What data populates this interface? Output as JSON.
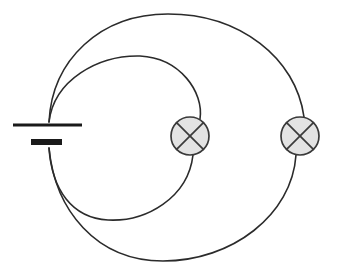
{
  "diagram": {
    "background_color": "#ffffff",
    "wire_color": "#2b2b2b",
    "lamp_fill_color": "#e3e3e3",
    "lamp_stroke_color": "#3a3a3a",
    "battery_color": "#1a1a1a",
    "width": 346,
    "height": 272
  },
  "components": {
    "battery": {
      "name": "battery",
      "icon": "battery-cell-icon",
      "positive_plate": {
        "label": "long-plate",
        "x1": 13,
        "y1": 125,
        "x2": 82,
        "y2": 125
      },
      "negative_plate": {
        "label": "short-plate",
        "x1": 31,
        "y1": 142,
        "x2": 62,
        "y2": 142
      }
    },
    "lamps": [
      {
        "name": "lamp-inner-loop",
        "icon": "lamp-cross-circle-icon",
        "cx": 190,
        "cy": 136,
        "r": 19
      },
      {
        "name": "lamp-outer-loop",
        "icon": "lamp-cross-circle-icon",
        "cx": 300,
        "cy": 136,
        "r": 19
      }
    ],
    "loops": [
      {
        "name": "outer-loop-wire",
        "path_top": "M 49,122 C 52,60 100,14 168,14 C 240,14 296,58 304,117",
        "path_bottom": "M 296,155 C 292,215 232,261 163,261 C 96,261 55,210 49,148"
      },
      {
        "name": "inner-loop-wire",
        "path_top": "M 49,122 C 54,80 98,55 140,56 C 180,58 204,92 200,119",
        "path_bottom": "M 193,155 C 188,198 146,222 108,220 C 72,218 52,190 49,148"
      }
    ]
  }
}
